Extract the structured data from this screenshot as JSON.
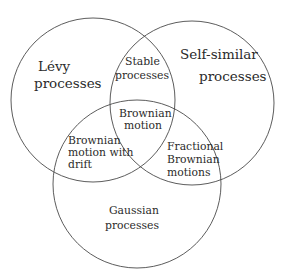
{
  "diagram": {
    "type": "venn",
    "sets": [
      {
        "id": "levy",
        "label_lines": [
          "Lévy",
          "processes"
        ],
        "circle": {
          "cx": 93,
          "cy": 100,
          "r": 82
        }
      },
      {
        "id": "self_similar",
        "label_lines": [
          "Self-similar",
          "processes"
        ],
        "circle": {
          "cx": 192,
          "cy": 103,
          "r": 82
        }
      },
      {
        "id": "gaussian",
        "label_lines": [
          "Gaussian",
          "processes"
        ],
        "circle": {
          "cx": 137,
          "cy": 184,
          "r": 84
        }
      }
    ],
    "intersections": [
      {
        "sets": [
          "levy",
          "self_similar"
        ],
        "label_lines": [
          "Stable",
          "processes"
        ]
      },
      {
        "sets": [
          "levy",
          "self_similar",
          "gaussian"
        ],
        "label_lines": [
          "Brownian",
          "motion"
        ]
      },
      {
        "sets": [
          "levy",
          "gaussian"
        ],
        "label_lines": [
          "Brownian",
          "motion with",
          "drift"
        ]
      },
      {
        "sets": [
          "self_similar",
          "gaussian"
        ],
        "label_lines": [
          "Fractional",
          "Brownian",
          "motions"
        ]
      }
    ],
    "stroke_color": "#4a4a4a",
    "text_color": "#2b2b2b",
    "background": "#ffffff"
  }
}
